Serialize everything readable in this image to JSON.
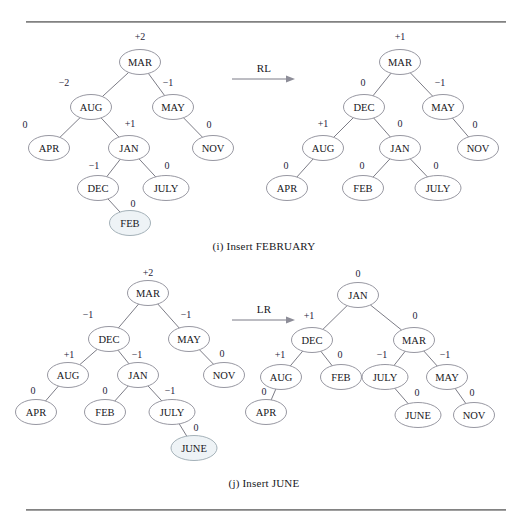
{
  "page": {
    "background": "#ffffff",
    "node_fill": "#ffffff",
    "node_stroke": "#8b8b96",
    "highlight_fill": "#eef3f6",
    "edge_color": "#6d6d78",
    "balance_factor_color": "#24243a",
    "rule_color": "#6f6f6f"
  },
  "figures": [
    {
      "id": "figure-i",
      "caption": "(i) Insert FEBRUARY",
      "operation_label": "RL",
      "inserted_key": "FEB",
      "before": {
        "nodes": [
          {
            "id": "MAR",
            "label": "MAR",
            "bf": "+2",
            "x": 140,
            "y": 62,
            "bf_x": 140,
            "bf_y": 36,
            "highlight": false
          },
          {
            "id": "AUG",
            "label": "AUG",
            "bf": "−2",
            "x": 91,
            "y": 107,
            "bf_x": 64,
            "bf_y": 82,
            "highlight": false
          },
          {
            "id": "MAY",
            "label": "MAY",
            "bf": "−1",
            "x": 173,
            "y": 107,
            "bf_x": 168,
            "bf_y": 82,
            "highlight": false
          },
          {
            "id": "APR",
            "label": "APR",
            "bf": "0",
            "x": 49,
            "y": 148,
            "bf_x": 25,
            "bf_y": 124,
            "highlight": false
          },
          {
            "id": "JAN",
            "label": "JAN",
            "bf": "+1",
            "x": 129,
            "y": 148,
            "bf_x": 130,
            "bf_y": 123,
            "highlight": false
          },
          {
            "id": "NOV",
            "label": "NOV",
            "bf": "0",
            "x": 213,
            "y": 148,
            "bf_x": 209,
            "bf_y": 124,
            "highlight": false
          },
          {
            "id": "DEC",
            "label": "DEC",
            "bf": "−1",
            "x": 98,
            "y": 188,
            "bf_x": 94,
            "bf_y": 165,
            "highlight": false
          },
          {
            "id": "JULY",
            "label": "JULY",
            "bf": "0",
            "x": 166,
            "y": 188,
            "bf_x": 167,
            "bf_y": 165,
            "highlight": false
          },
          {
            "id": "FEB",
            "label": "FEB",
            "bf": "0",
            "x": 130,
            "y": 223,
            "bf_x": 133,
            "bf_y": 203,
            "highlight": true
          }
        ],
        "edges": [
          [
            "MAR",
            "AUG"
          ],
          [
            "MAR",
            "MAY"
          ],
          [
            "AUG",
            "APR"
          ],
          [
            "AUG",
            "JAN"
          ],
          [
            "MAY",
            "NOV"
          ],
          [
            "JAN",
            "DEC"
          ],
          [
            "JAN",
            "JULY"
          ],
          [
            "DEC",
            "FEB"
          ]
        ]
      },
      "after": {
        "nodes": [
          {
            "id": "MAR",
            "label": "MAR",
            "bf": "+1",
            "x": 400,
            "y": 62,
            "bf_x": 400,
            "bf_y": 36,
            "highlight": false
          },
          {
            "id": "DEC",
            "label": "DEC",
            "bf": "0",
            "x": 364,
            "y": 107,
            "bf_x": 363,
            "bf_y": 82,
            "highlight": false
          },
          {
            "id": "MAY",
            "label": "MAY",
            "bf": "−1",
            "x": 443,
            "y": 107,
            "bf_x": 440,
            "bf_y": 82,
            "highlight": false
          },
          {
            "id": "AUG",
            "label": "AUG",
            "bf": "+1",
            "x": 323,
            "y": 148,
            "bf_x": 323,
            "bf_y": 123,
            "highlight": false
          },
          {
            "id": "JAN",
            "label": "JAN",
            "bf": "0",
            "x": 400,
            "y": 148,
            "bf_x": 400,
            "bf_y": 123,
            "highlight": false
          },
          {
            "id": "NOV",
            "label": "NOV",
            "bf": "0",
            "x": 478,
            "y": 148,
            "bf_x": 475,
            "bf_y": 124,
            "highlight": false
          },
          {
            "id": "APR",
            "label": "APR",
            "bf": "0",
            "x": 287,
            "y": 188,
            "bf_x": 286,
            "bf_y": 165,
            "highlight": false
          },
          {
            "id": "FEB",
            "label": "FEB",
            "bf": "0",
            "x": 363,
            "y": 188,
            "bf_x": 362,
            "bf_y": 165,
            "highlight": false
          },
          {
            "id": "JULY",
            "label": "JULY",
            "bf": "0",
            "x": 438,
            "y": 188,
            "bf_x": 436,
            "bf_y": 165,
            "highlight": false
          }
        ],
        "edges": [
          [
            "MAR",
            "DEC"
          ],
          [
            "MAR",
            "MAY"
          ],
          [
            "DEC",
            "AUG"
          ],
          [
            "DEC",
            "JAN"
          ],
          [
            "MAY",
            "NOV"
          ],
          [
            "AUG",
            "APR"
          ],
          [
            "JAN",
            "FEB"
          ],
          [
            "JAN",
            "JULY"
          ]
        ]
      }
    },
    {
      "id": "figure-j",
      "caption": "(j) Insert JUNE",
      "operation_label": "LR",
      "inserted_key": "JUNE",
      "before": {
        "nodes": [
          {
            "id": "MAR",
            "label": "MAR",
            "bf": "+2",
            "x": 148,
            "y": 293,
            "bf_x": 148,
            "bf_y": 272,
            "highlight": false
          },
          {
            "id": "DEC",
            "label": "DEC",
            "bf": "−1",
            "x": 109,
            "y": 339,
            "bf_x": 88,
            "bf_y": 314,
            "highlight": false
          },
          {
            "id": "MAY",
            "label": "MAY",
            "bf": "−1",
            "x": 189,
            "y": 339,
            "bf_x": 186,
            "bf_y": 314,
            "highlight": false
          },
          {
            "id": "AUG",
            "label": "AUG",
            "bf": "+1",
            "x": 68,
            "y": 375,
            "bf_x": 69,
            "bf_y": 354,
            "highlight": false
          },
          {
            "id": "JAN",
            "label": "JAN",
            "bf": "−1",
            "x": 138,
            "y": 375,
            "bf_x": 137,
            "bf_y": 354,
            "highlight": false
          },
          {
            "id": "NOV",
            "label": "NOV",
            "bf": "0",
            "x": 224,
            "y": 375,
            "bf_x": 222,
            "bf_y": 353,
            "highlight": false
          },
          {
            "id": "APR",
            "label": "APR",
            "bf": "0",
            "x": 36,
            "y": 412,
            "bf_x": 33,
            "bf_y": 390,
            "highlight": false
          },
          {
            "id": "FEB",
            "label": "FEB",
            "bf": "0",
            "x": 105,
            "y": 412,
            "bf_x": 105,
            "bf_y": 390,
            "highlight": false
          },
          {
            "id": "JULY",
            "label": "JULY",
            "bf": "−1",
            "x": 172,
            "y": 412,
            "bf_x": 170,
            "bf_y": 390,
            "highlight": false
          },
          {
            "id": "JUNE",
            "label": "JUNE",
            "bf": "0",
            "x": 194,
            "y": 448,
            "bf_x": 196,
            "bf_y": 427,
            "highlight": true
          }
        ],
        "edges": [
          [
            "MAR",
            "DEC"
          ],
          [
            "MAR",
            "MAY"
          ],
          [
            "DEC",
            "AUG"
          ],
          [
            "DEC",
            "JAN"
          ],
          [
            "MAY",
            "NOV"
          ],
          [
            "AUG",
            "APR"
          ],
          [
            "JAN",
            "FEB"
          ],
          [
            "JAN",
            "JULY"
          ],
          [
            "JULY",
            "JUNE"
          ]
        ]
      },
      "after": {
        "nodes": [
          {
            "id": "JAN",
            "label": "JAN",
            "bf": "0",
            "x": 358,
            "y": 295,
            "bf_x": 358,
            "bf_y": 273,
            "highlight": false
          },
          {
            "id": "DEC",
            "label": "DEC",
            "bf": "+1",
            "x": 312,
            "y": 340,
            "bf_x": 309,
            "bf_y": 315,
            "highlight": false
          },
          {
            "id": "MAR",
            "label": "MAR",
            "bf": "0",
            "x": 414,
            "y": 340,
            "bf_x": 415,
            "bf_y": 315,
            "highlight": false
          },
          {
            "id": "AUG",
            "label": "AUG",
            "bf": "+1",
            "x": 281,
            "y": 377,
            "bf_x": 280,
            "bf_y": 354,
            "highlight": false
          },
          {
            "id": "FEB",
            "label": "FEB",
            "bf": "0",
            "x": 341,
            "y": 377,
            "bf_x": 340,
            "bf_y": 354,
            "highlight": false
          },
          {
            "id": "JULY",
            "label": "JULY",
            "bf": "−1",
            "x": 385,
            "y": 377,
            "bf_x": 382,
            "bf_y": 354,
            "highlight": false
          },
          {
            "id": "MAY",
            "label": "MAY",
            "bf": "−1",
            "x": 447,
            "y": 377,
            "bf_x": 445,
            "bf_y": 354,
            "highlight": false
          },
          {
            "id": "APR",
            "label": "APR",
            "bf": "0",
            "x": 266,
            "y": 412,
            "bf_x": 264,
            "bf_y": 391,
            "highlight": false
          },
          {
            "id": "JUNE",
            "label": "JUNE",
            "bf": "0",
            "x": 418,
            "y": 415,
            "bf_x": 417,
            "bf_y": 392,
            "highlight": false
          },
          {
            "id": "NOV",
            "label": "NOV",
            "bf": "0",
            "x": 474,
            "y": 415,
            "bf_x": 472,
            "bf_y": 392,
            "highlight": false
          }
        ],
        "edges": [
          [
            "JAN",
            "DEC"
          ],
          [
            "JAN",
            "MAR"
          ],
          [
            "DEC",
            "AUG"
          ],
          [
            "DEC",
            "FEB"
          ],
          [
            "MAR",
            "JULY"
          ],
          [
            "MAR",
            "MAY"
          ],
          [
            "AUG",
            "APR"
          ],
          [
            "JULY",
            "JUNE"
          ],
          [
            "MAY",
            "NOV"
          ]
        ]
      }
    }
  ]
}
